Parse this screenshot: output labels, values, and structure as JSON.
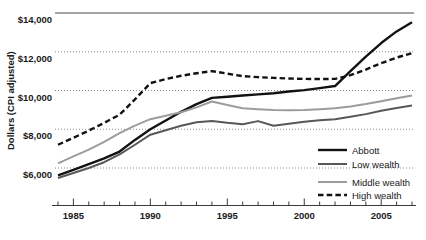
{
  "chart_data": {
    "type": "line",
    "title": "",
    "xlabel": "",
    "ylabel": "Dollars (CPI adjusted)",
    "xlim": [
      1984,
      2007
    ],
    "ylim": [
      4750,
      14000
    ],
    "grid": true,
    "legend_position": "bottom-right",
    "ytick_labels": [
      "$14,000",
      "$12,000",
      "$10,000",
      "$8,000",
      "$6,000"
    ],
    "ytick_values": [
      14000,
      12000,
      10000,
      8000,
      6000
    ],
    "xtick_labels": [
      "1985",
      "1990",
      "1995",
      "2000",
      "2005"
    ],
    "xtick_values": [
      1985,
      1990,
      1995,
      2000,
      2005
    ],
    "x": [
      1984,
      1985,
      1986,
      1987,
      1988,
      1989,
      1990,
      1991,
      1992,
      1993,
      1994,
      1995,
      1996,
      1997,
      1998,
      1999,
      2000,
      2001,
      2002,
      2003,
      2004,
      2005,
      2006,
      2007
    ],
    "series": [
      {
        "name": "Abbott",
        "color": "#121212",
        "style": "solid",
        "width": 2.4,
        "values": [
          5620,
          5900,
          6200,
          6500,
          6850,
          7450,
          8000,
          8450,
          8900,
          9300,
          9620,
          9680,
          9740,
          9800,
          9860,
          9950,
          10020,
          10120,
          10230,
          11000,
          11750,
          12450,
          13050,
          13520
        ]
      },
      {
        "name": "Low wealth",
        "color": "#585858",
        "style": "solid",
        "width": 2.0,
        "values": [
          5480,
          5740,
          6000,
          6300,
          6700,
          7200,
          7720,
          7950,
          8180,
          8360,
          8430,
          8330,
          8260,
          8420,
          8180,
          8280,
          8390,
          8460,
          8520,
          8640,
          8780,
          8950,
          9100,
          9230
        ]
      },
      {
        "name": "Middle wealth",
        "color": "#9c9c9c",
        "style": "solid",
        "width": 2.0,
        "values": [
          6240,
          6600,
          6950,
          7350,
          7800,
          8190,
          8520,
          8700,
          8880,
          9130,
          9430,
          9250,
          9080,
          9030,
          8990,
          8980,
          8990,
          9030,
          9080,
          9180,
          9300,
          9450,
          9600,
          9740
        ]
      },
      {
        "name": "High wealth",
        "color": "#121212",
        "style": "dashed",
        "width": 2.4,
        "values": [
          7200,
          7560,
          7930,
          8330,
          8750,
          9540,
          10380,
          10590,
          10760,
          10890,
          11000,
          10870,
          10740,
          10690,
          10650,
          10620,
          10600,
          10590,
          10600,
          10790,
          11080,
          11410,
          11700,
          11930
        ]
      }
    ]
  },
  "legend": {
    "items": [
      {
        "label": "Abbott"
      },
      {
        "label": "Low wealth"
      },
      {
        "label": "Middle wealth"
      },
      {
        "label": "High wealth"
      }
    ]
  }
}
